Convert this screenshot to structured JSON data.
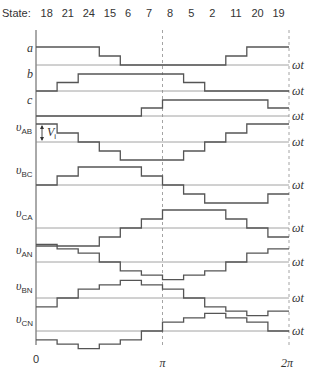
{
  "header": {
    "label": "State:",
    "states": [
      "18",
      "21",
      "24",
      "15",
      "6",
      "7",
      "8",
      "5",
      "2",
      "11",
      "20",
      "19"
    ]
  },
  "axis": {
    "x_ticks": [
      "0",
      "π",
      "2π"
    ],
    "row_axis_label": "ωt"
  },
  "annotation": {
    "label": "V",
    "subscript": "i"
  },
  "colors": {
    "wave": "#555555",
    "baseline": "#8a8a8a",
    "dashed": "#9a9a9a",
    "text": "#333333"
  },
  "chart_data": {
    "type": "line",
    "title": "",
    "xlabel": "ωt",
    "x_ticks": [
      "0",
      "π",
      "2π"
    ],
    "categories": [
      "18",
      "21",
      "24",
      "15",
      "6",
      "7",
      "8",
      "5",
      "2",
      "11",
      "20",
      "19"
    ],
    "series": [
      {
        "name": "a",
        "label": "a",
        "sub": "",
        "values": [
          2,
          2,
          2,
          1,
          0,
          0,
          0,
          0,
          0,
          1,
          2,
          2
        ]
      },
      {
        "name": "b",
        "label": "b",
        "sub": "",
        "values": [
          0,
          1,
          2,
          2,
          2,
          2,
          2,
          1,
          0,
          0,
          0,
          0
        ]
      },
      {
        "name": "c",
        "label": "c",
        "sub": "",
        "values": [
          0,
          0,
          0,
          0,
          0,
          1,
          2,
          2,
          2,
          2,
          2,
          1
        ]
      },
      {
        "name": "vAB",
        "label": "υ",
        "sub": "AB",
        "values": [
          2,
          1,
          0,
          -1,
          -2,
          -2,
          -2,
          -1,
          0,
          1,
          2,
          2
        ]
      },
      {
        "name": "vBC",
        "label": "υ",
        "sub": "BC",
        "values": [
          0,
          1,
          2,
          2,
          2,
          1,
          0,
          -1,
          -2,
          -2,
          -2,
          -1
        ]
      },
      {
        "name": "vCA",
        "label": "υ",
        "sub": "CA",
        "values": [
          -2,
          -2,
          -2,
          -1,
          0,
          1,
          2,
          2,
          2,
          1,
          0,
          -1
        ]
      },
      {
        "name": "vAN",
        "label": "υ",
        "sub": "AN",
        "values": [
          4,
          3,
          2,
          0,
          -2,
          -3,
          -4,
          -3,
          -2,
          0,
          2,
          3
        ]
      },
      {
        "name": "vBN",
        "label": "υ",
        "sub": "BN",
        "values": [
          -2,
          0,
          2,
          3,
          4,
          3,
          2,
          0,
          -2,
          -3,
          -4,
          -3
        ]
      },
      {
        "name": "vCN",
        "label": "υ",
        "sub": "CN",
        "values": [
          -2,
          -3,
          -4,
          -3,
          -2,
          0,
          2,
          3,
          4,
          3,
          2,
          0
        ]
      }
    ],
    "grid": false,
    "legend": "none"
  }
}
